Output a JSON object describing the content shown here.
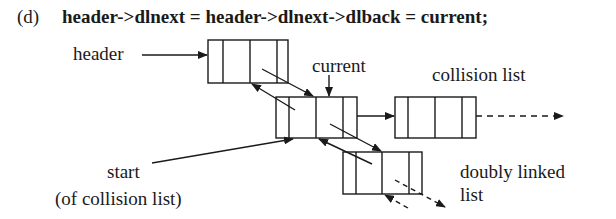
{
  "figure": {
    "tag": "(d)",
    "statement": "header->dlnext = header->dlnext->dlback = current;"
  },
  "labels": {
    "header": "header",
    "current": "current",
    "collision_list": "collision list",
    "start": "start",
    "start_note": "(of collision list)",
    "doubly_linked_1": "doubly linked",
    "doubly_linked_2": "list"
  },
  "nodes": [
    {
      "name": "header-node",
      "x": 208,
      "y": 40,
      "w": 80,
      "h": 43,
      "dividers": [
        15,
        42,
        69
      ]
    },
    {
      "name": "current-node",
      "x": 276,
      "y": 97,
      "w": 81,
      "h": 41,
      "dividers": [
        13,
        40,
        67
      ]
    },
    {
      "name": "collision-next-node",
      "x": 395,
      "y": 97,
      "w": 81,
      "h": 41,
      "dividers": [
        13,
        40,
        67
      ]
    },
    {
      "name": "dl-next-node",
      "x": 343,
      "y": 152,
      "w": 79,
      "h": 42,
      "dividers": [
        13,
        39,
        66
      ]
    }
  ]
}
